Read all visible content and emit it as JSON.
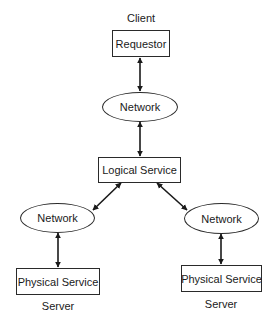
{
  "diagram": {
    "colors": {
      "stroke": "#2a2a2a",
      "text": "#1a1a1a",
      "background": "#ffffff"
    },
    "labels": {
      "client": "Client",
      "server_left": "Server",
      "server_right": "Server"
    },
    "nodes": {
      "requestor": {
        "label": "Requestor",
        "shape": "rectangle"
      },
      "network_top": {
        "label": "Network",
        "shape": "ellipse"
      },
      "logical_service": {
        "label": "Logical Service",
        "shape": "rectangle"
      },
      "network_left": {
        "label": "Network",
        "shape": "ellipse"
      },
      "network_right": {
        "label": "Network",
        "shape": "ellipse"
      },
      "physical_service_left": {
        "label": "Physical Service",
        "shape": "rectangle"
      },
      "physical_service_right": {
        "label": "Physical Service",
        "shape": "rectangle"
      }
    },
    "edges": [
      {
        "from": "requestor",
        "to": "network_top",
        "type": "bidirectional-arrow"
      },
      {
        "from": "network_top",
        "to": "logical_service",
        "type": "bidirectional-arrow"
      },
      {
        "from": "logical_service",
        "to": "network_left",
        "type": "bidirectional-arrow"
      },
      {
        "from": "logical_service",
        "to": "network_right",
        "type": "bidirectional-arrow"
      },
      {
        "from": "network_left",
        "to": "physical_service_left",
        "type": "bidirectional-arrow"
      },
      {
        "from": "network_right",
        "to": "physical_service_right",
        "type": "bidirectional-arrow"
      }
    ]
  }
}
